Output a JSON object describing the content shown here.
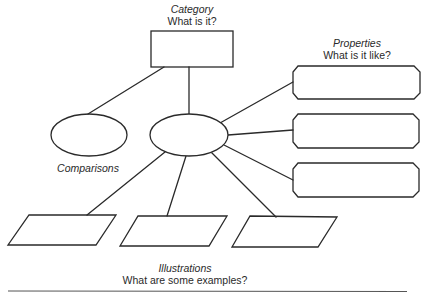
{
  "diagram": {
    "category": {
      "title": "Category",
      "question": "What is it?"
    },
    "properties": {
      "title": "Properties",
      "question": "What is it like?"
    },
    "comparisons": {
      "title": "Comparisons"
    },
    "illustrations": {
      "title": "Illustrations",
      "question": "What are some examples?"
    },
    "shapes": {
      "category_box": "rectangle",
      "center_node": "ellipse",
      "comparison_node": "ellipse",
      "property_boxes": 3,
      "illustration_boxes": 3
    },
    "colors": {
      "stroke": "#2a2a2a",
      "background": "#ffffff",
      "rule": "#555555"
    }
  }
}
